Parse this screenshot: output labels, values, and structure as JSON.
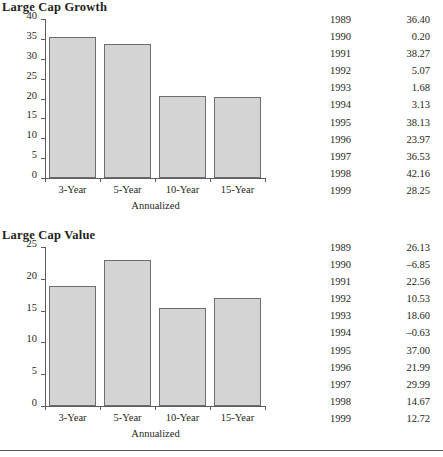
{
  "page": {
    "bottom_rule": true
  },
  "panels": [
    {
      "id": "large-cap-growth",
      "title": "Large Cap Growth",
      "chart_data": {
        "type": "bar",
        "title": "Large Cap Growth",
        "categories": [
          "3-Year",
          "5-Year",
          "10-Year",
          "15-Year"
        ],
        "values": [
          35.5,
          33.7,
          20.6,
          20.4
        ],
        "xlabel": "Annualized",
        "ylabel": "",
        "ylim": [
          0,
          40
        ],
        "yticks": [
          0,
          5,
          10,
          15,
          20,
          25,
          30,
          35,
          40
        ],
        "ytick_labels": [
          "0",
          "5",
          "10",
          "15",
          "20",
          "25",
          "30",
          "35",
          "40"
        ],
        "grid": false,
        "legend": false,
        "bar_color": "#d4d4d4",
        "bar_edge_color": "#6e6e6e"
      },
      "table": {
        "rows": [
          {
            "year": "1989",
            "value": "36.40"
          },
          {
            "year": "1990",
            "value": "0.20"
          },
          {
            "year": "1991",
            "value": "38.27"
          },
          {
            "year": "1992",
            "value": "5.07"
          },
          {
            "year": "1993",
            "value": "1.68"
          },
          {
            "year": "1994",
            "value": "3.13"
          },
          {
            "year": "1995",
            "value": "38.13"
          },
          {
            "year": "1996",
            "value": "23.97"
          },
          {
            "year": "1997",
            "value": "36.53"
          },
          {
            "year": "1998",
            "value": "42.16"
          },
          {
            "year": "1999",
            "value": "28.25"
          }
        ]
      }
    },
    {
      "id": "large-cap-value",
      "title": "Large Cap Value",
      "chart_data": {
        "type": "bar",
        "title": "Large Cap Value",
        "categories": [
          "3-Year",
          "5-Year",
          "10-Year",
          "15-Year"
        ],
        "values": [
          18.9,
          23.0,
          15.4,
          17.0
        ],
        "xlabel": "Annualized",
        "ylabel": "",
        "ylim": [
          0,
          25
        ],
        "yticks": [
          0,
          5,
          10,
          15,
          20,
          25
        ],
        "ytick_labels": [
          "0",
          "5",
          "10",
          "15",
          "20",
          "25"
        ],
        "grid": false,
        "legend": false,
        "bar_color": "#d4d4d4",
        "bar_edge_color": "#6e6e6e"
      },
      "table": {
        "rows": [
          {
            "year": "1989",
            "value": "26.13"
          },
          {
            "year": "1990",
            "value": "–6.85"
          },
          {
            "year": "1991",
            "value": "22.56"
          },
          {
            "year": "1992",
            "value": "10.53"
          },
          {
            "year": "1993",
            "value": "18.60"
          },
          {
            "year": "1994",
            "value": "–0.63"
          },
          {
            "year": "1995",
            "value": "37.00"
          },
          {
            "year": "1996",
            "value": "21.99"
          },
          {
            "year": "1997",
            "value": "29.99"
          },
          {
            "year": "1998",
            "value": "14.67"
          },
          {
            "year": "1999",
            "value": "12.72"
          }
        ]
      }
    }
  ]
}
